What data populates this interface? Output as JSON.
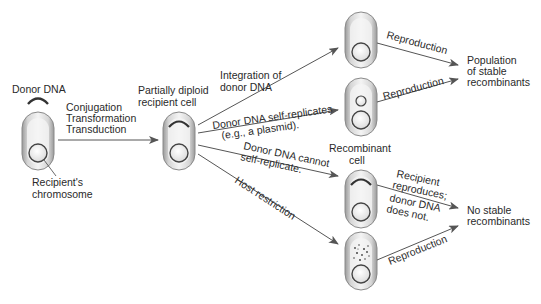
{
  "diagram": {
    "donor": {
      "donor_dna_label": "Donor DNA",
      "chromosome_label_line1": "Recipient's",
      "chromosome_label_line2": "chromosome"
    },
    "transfer": {
      "line1": "Conjugation",
      "line2": "Transformation",
      "line3": "Transduction"
    },
    "partial_cell": {
      "line1": "Partially diploid",
      "line2": "recipient cell"
    },
    "paths": [
      {
        "label_line1": "Integration of",
        "label_line2": "donor DNA"
      },
      {
        "label_line1": "Donor DNA self-replicates",
        "label_line2": "(e.g., a plasmid)."
      },
      {
        "label_line1": "Donor DNA cannot",
        "label_line2": "self-replicate."
      },
      {
        "label_line1": "Host restriction",
        "label_line2": ""
      }
    ],
    "recombinant_label_line1": "Recombinant",
    "recombinant_label_line2": "cell",
    "outcome_arrows": [
      {
        "label": "Reproduction"
      },
      {
        "label": "Reproduction"
      },
      {
        "label_line1": "Recipient",
        "label_line2": "reproduces;",
        "label_line3": "donor DNA",
        "label_line4": "does not."
      },
      {
        "label": "Reproduction"
      }
    ],
    "outcomes": {
      "stable": {
        "line1": "Population",
        "line2": "of stable",
        "line3": "recombinants"
      },
      "none": {
        "line1": "No stable",
        "line2": "recombinants"
      }
    }
  }
}
